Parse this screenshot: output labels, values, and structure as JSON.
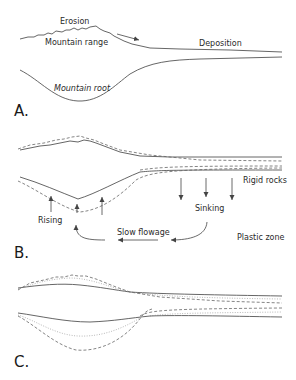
{
  "figure": {
    "panels": [
      {
        "id": "A",
        "label": "A.",
        "annotations": {
          "erosion": "Erosion",
          "mountain_range": "Mountain range",
          "deposition": "Deposition",
          "mountain_root": "Mountain root"
        }
      },
      {
        "id": "B",
        "label": "B.",
        "annotations": {
          "rigid_rocks": "Rigid rocks",
          "sinking": "Sinking",
          "rising": "Rising",
          "slow_flowage": "Slow flowage",
          "plastic_zone": "Plastic zone"
        }
      },
      {
        "id": "C",
        "label": "C.",
        "annotations": {}
      }
    ],
    "line_styles": {
      "solid": "original profile",
      "dashed": "adjusted profile",
      "dotted": "intermediate profile"
    },
    "colors": {
      "line": "#555555",
      "text": "#2a2a2a",
      "background": "#ffffff"
    }
  }
}
